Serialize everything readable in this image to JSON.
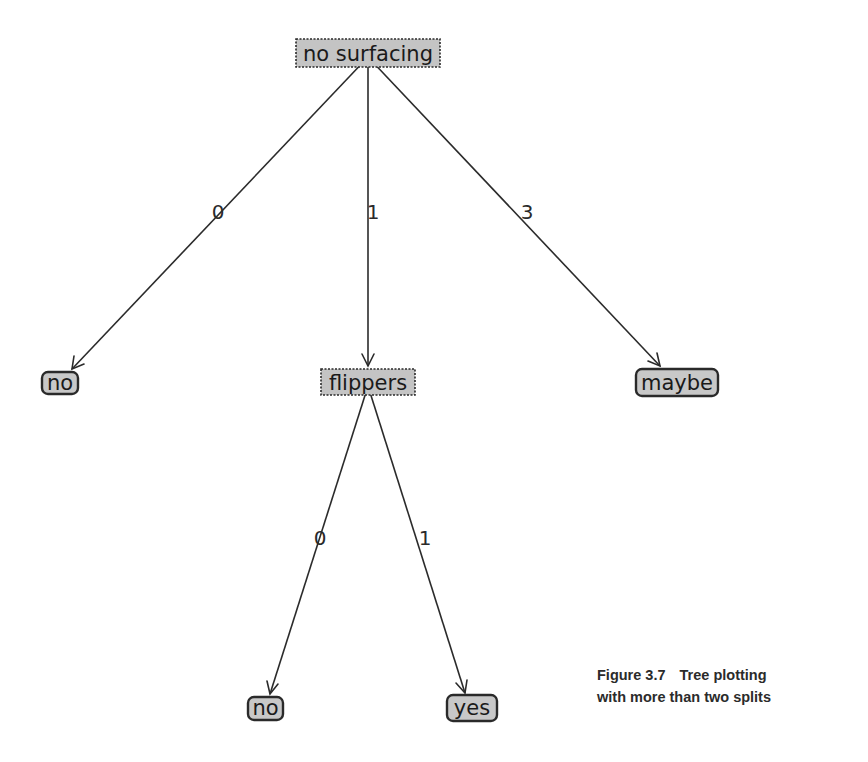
{
  "figure": {
    "caption": {
      "number": "Figure 3.7",
      "line1_text": "Tree plotting",
      "line2_text": "with more than two splits"
    }
  },
  "tree": {
    "root": {
      "label": "no surfacing",
      "type": "decision",
      "edges": [
        {
          "label": "0",
          "target": "no"
        },
        {
          "label": "1",
          "target": "flippers"
        },
        {
          "label": "3",
          "target": "maybe"
        }
      ]
    },
    "nodes": {
      "leaf_no_1": {
        "label": "no",
        "type": "leaf"
      },
      "flippers": {
        "label": "flippers",
        "type": "decision"
      },
      "leaf_maybe": {
        "label": "maybe",
        "type": "leaf"
      },
      "leaf_no_2": {
        "label": "no",
        "type": "leaf"
      },
      "leaf_yes": {
        "label": "yes",
        "type": "leaf"
      }
    },
    "edge_labels": {
      "root_to_no": "0",
      "root_to_flippers": "1",
      "root_to_maybe": "3",
      "flippers_to_no": "0",
      "flippers_to_yes": "1"
    }
  },
  "colors": {
    "node_fill": "#c4c4c4",
    "stroke": "#2b2b2b",
    "background": "#ffffff"
  }
}
